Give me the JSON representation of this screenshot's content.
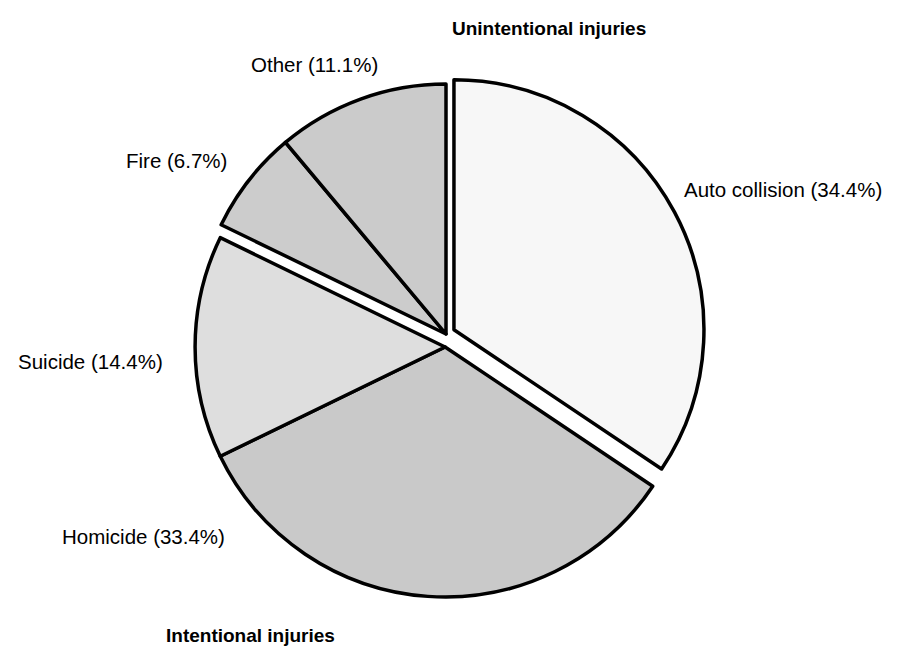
{
  "chart_data": {
    "type": "pie",
    "title": "",
    "categories": [
      "Auto collision",
      "Homicide",
      "Suicide",
      "Fire",
      "Other"
    ],
    "values": [
      34.4,
      33.4,
      14.4,
      6.7,
      11.1
    ],
    "value_unit": "%",
    "slices": [
      {
        "name": "Auto collision",
        "label": "Auto collision (34.4%)",
        "value": 34.4,
        "color": "#f7f7f7",
        "group": "Unintentional injuries",
        "start_angle": 0,
        "end_angle": 123.84,
        "exploded": true
      },
      {
        "name": "Homicide",
        "label": "Homicide (33.4%)",
        "value": 33.4,
        "color": "#c9c9c9",
        "group": "Intentional injuries",
        "start_angle": 123.84,
        "end_angle": 244.08,
        "exploded": true
      },
      {
        "name": "Suicide",
        "label": "Suicide (14.4%)",
        "value": 14.4,
        "color": "#dedede",
        "group": "Intentional injuries",
        "start_angle": 244.08,
        "end_angle": 295.92,
        "exploded": true
      },
      {
        "name": "Fire",
        "label": "Fire (6.7%)",
        "value": 6.7,
        "color": "#cccccc",
        "group": "Unintentional injuries",
        "start_angle": 295.92,
        "end_angle": 320.04,
        "exploded": false
      },
      {
        "name": "Other",
        "label": "Other (11.1%)",
        "value": 11.1,
        "color": "#cbcbcb",
        "group": "Unintentional injuries",
        "start_angle": 320.04,
        "end_angle": 360,
        "exploded": false
      }
    ],
    "group_labels": [
      {
        "name": "unintentional",
        "text": "Unintentional injuries",
        "position": "top"
      },
      {
        "name": "intentional",
        "text": "Intentional injuries",
        "position": "bottom-left"
      }
    ],
    "geometry": {
      "center_x": 446,
      "center_y": 334,
      "radius": 250,
      "stroke_color": "#000000",
      "stroke_width": 3.5,
      "background": "#ffffff"
    },
    "legend": "none",
    "grid": false
  }
}
